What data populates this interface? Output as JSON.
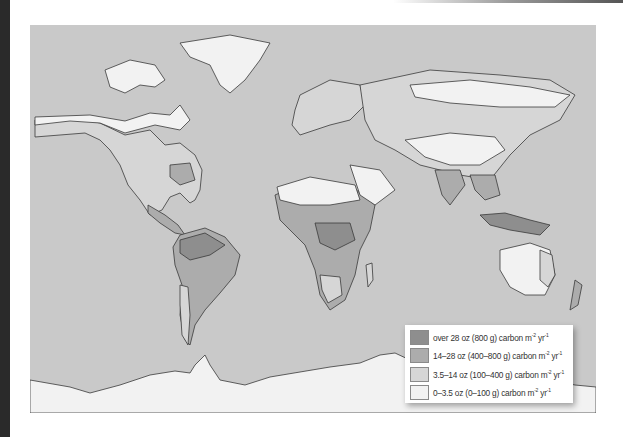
{
  "map": {
    "title": "",
    "type": "world-map",
    "description": "World net primary productivity (carbon per square metre per year)",
    "colors": {
      "ocean": "#c9c9c9",
      "coastline": "#3a3a3a",
      "frame_strip": "#2a2a2a"
    }
  },
  "legend": {
    "items": [
      {
        "label": "over 28 oz (800 g) carbon m",
        "unit_sup1": "-2",
        "unit_mid": " yr",
        "unit_sup2": "-1",
        "color": "#8e8e8e"
      },
      {
        "label": "14–28 oz (400–800 g) carbon m",
        "unit_sup1": "-2",
        "unit_mid": " yr",
        "unit_sup2": "-1",
        "color": "#acacac"
      },
      {
        "label": "3.5–14 oz (100–400 g) carbon m",
        "unit_sup1": "-2",
        "unit_mid": " yr",
        "unit_sup2": "-1",
        "color": "#d6d6d6"
      },
      {
        "label": "0–3.5 oz (0–100 g) carbon m",
        "unit_sup1": "-2",
        "unit_mid": " yr",
        "unit_sup2": "-1",
        "color": "#f2f2f2"
      }
    ]
  }
}
